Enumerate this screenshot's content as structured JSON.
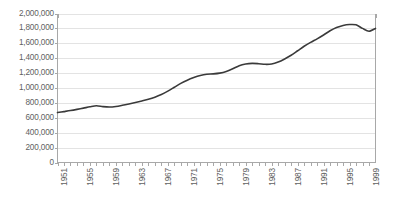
{
  "chart_data": {
    "type": "line",
    "title": "",
    "xlabel": "",
    "ylabel": "",
    "ylim": [
      0,
      2000000
    ],
    "xlim": [
      1951,
      2000
    ],
    "grid": true,
    "legend": false,
    "legend_position": "none",
    "line_color": "#3a3a3a",
    "gridline_color": "#e3e3e3",
    "axis_color": "#a8a8a8",
    "label_color": "#5f5f5f",
    "y_ticks": [
      {
        "value": 2000000,
        "label": "2,000,000"
      },
      {
        "value": 1800000,
        "label": "1,800,000"
      },
      {
        "value": 1600000,
        "label": "1,600,000"
      },
      {
        "value": 1400000,
        "label": "1,400,000"
      },
      {
        "value": 1200000,
        "label": "1,200,000"
      },
      {
        "value": 1000000,
        "label": "1,000,000"
      },
      {
        "value": 800000,
        "label": "800,000"
      },
      {
        "value": 600000,
        "label": "600,000"
      },
      {
        "value": 400000,
        "label": "400,000"
      },
      {
        "value": 200000,
        "label": "200,000"
      },
      {
        "value": 0,
        "label": "0"
      }
    ],
    "x_tick_labels": [
      "1951",
      "1955",
      "1959",
      "1963",
      "1967",
      "1971",
      "1975",
      "1979",
      "1983",
      "1987",
      "1991",
      "1995",
      "1999"
    ],
    "x_tick_label_interval": 4,
    "x_minor_tick_interval": 1,
    "series": [
      {
        "name": "series-1",
        "x": [
          1951,
          1952,
          1953,
          1954,
          1955,
          1956,
          1957,
          1958,
          1959,
          1960,
          1961,
          1962,
          1963,
          1964,
          1965,
          1966,
          1967,
          1968,
          1969,
          1970,
          1971,
          1972,
          1973,
          1974,
          1975,
          1976,
          1977,
          1978,
          1979,
          1980,
          1981,
          1982,
          1983,
          1984,
          1985,
          1986,
          1987,
          1988,
          1989,
          1990,
          1991,
          1992,
          1993,
          1994,
          1995,
          1996,
          1997,
          1998,
          1999,
          2000
        ],
        "values": [
          670000,
          683000,
          697000,
          713000,
          730000,
          748000,
          762000,
          750000,
          744000,
          752000,
          768000,
          786000,
          805000,
          826000,
          848000,
          876000,
          912000,
          958000,
          1010000,
          1062000,
          1105000,
          1140000,
          1168000,
          1185000,
          1190000,
          1200000,
          1222000,
          1258000,
          1300000,
          1322000,
          1330000,
          1326000,
          1318000,
          1322000,
          1348000,
          1390000,
          1440000,
          1500000,
          1560000,
          1612000,
          1660000,
          1712000,
          1768000,
          1812000,
          1840000,
          1852000,
          1848000,
          1800000,
          1762000,
          1800000
        ]
      }
    ]
  }
}
